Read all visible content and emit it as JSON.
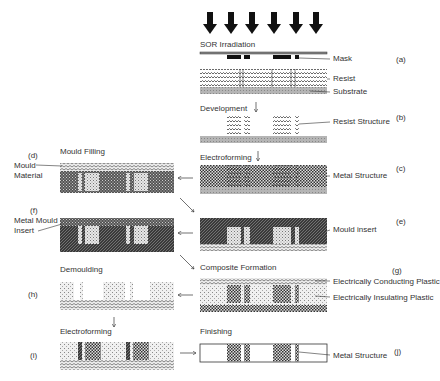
{
  "diagram": {
    "steps": {
      "a": {
        "tag": "(a)",
        "process": "SOR Irradiation",
        "labels": [
          "Mask",
          "Resist",
          "Substrate"
        ]
      },
      "b": {
        "tag": "(b)",
        "process": "Development",
        "labels": [
          "Resist Structure"
        ]
      },
      "c": {
        "tag": "(c)",
        "process": "Electroforming",
        "labels": [
          "Metal Structure"
        ]
      },
      "d": {
        "tag": "(d)",
        "process": "Mould Filling",
        "labels": [
          "Mould",
          "Material"
        ]
      },
      "e": {
        "tag": "(e)",
        "process": "",
        "labels": [
          "Mould insert"
        ]
      },
      "f": {
        "tag": "(f)",
        "process": "",
        "labels": [
          "Metal Mould",
          "Insert"
        ]
      },
      "g": {
        "tag": "(g)",
        "process": "Composite Formation",
        "labels": [
          "Electrically Conducting Plastic",
          "Electrically Insulating Plastic"
        ]
      },
      "h": {
        "tag": "(h)",
        "process": "Demoulding",
        "labels": []
      },
      "i": {
        "tag": "(i)",
        "process": "Electroforming",
        "labels": []
      },
      "j": {
        "tag": "(j)",
        "process": "Finishing",
        "labels": [
          "Metal Structure"
        ]
      }
    },
    "colors": {
      "line": "#222222",
      "metal": "#555555",
      "resist": "#999999",
      "substrate": "#aaaaaa",
      "dark": "#333333"
    }
  }
}
